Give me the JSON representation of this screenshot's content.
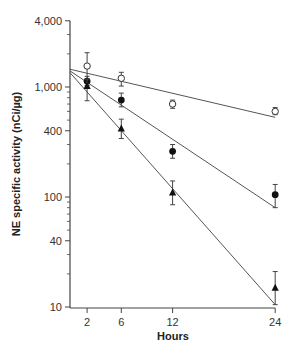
{
  "chart_data": {
    "type": "scatter",
    "title": "",
    "xlabel": "Hours",
    "ylabel": "NE specific activity (nCi/µg)",
    "yscale": "log",
    "xlim": [
      0,
      24
    ],
    "ylim": [
      10,
      4000
    ],
    "x_ticks": [
      2,
      6,
      12,
      24
    ],
    "x_tick_labels": [
      "2",
      "6",
      "12",
      "24"
    ],
    "y_ticks": [
      10,
      40,
      100,
      400,
      1000,
      4000
    ],
    "y_tick_labels": [
      "10",
      "40",
      "100",
      "400",
      "1,000",
      "4,000"
    ],
    "grid": false,
    "legend": null,
    "x": [
      2,
      6,
      12,
      24
    ],
    "series": [
      {
        "name": "open circles",
        "marker": "open-circle",
        "values": [
          1550,
          1200,
          700,
          600
        ],
        "error_low": [
          1150,
          1020,
          640,
          560
        ],
        "error_high": [
          2050,
          1360,
          760,
          650
        ],
        "fit_line": {
          "x": [
            0,
            24
          ],
          "y": [
            1450,
            530
          ]
        }
      },
      {
        "name": "filled circles",
        "marker": "filled-circle",
        "values": [
          1130,
          760,
          260,
          105
        ],
        "error_low": [
          1030,
          660,
          225,
          80
        ],
        "error_high": [
          1250,
          880,
          300,
          130
        ],
        "fit_line": {
          "x": [
            0,
            24
          ],
          "y": [
            1400,
            80
          ]
        }
      },
      {
        "name": "filled triangles",
        "marker": "filled-triangle",
        "values": [
          1020,
          420,
          110,
          15
        ],
        "error_low": [
          750,
          340,
          85,
          10.5
        ],
        "error_high": [
          1180,
          510,
          140,
          21
        ],
        "fit_line": {
          "x": [
            0,
            24
          ],
          "y": [
            1350,
            10.5
          ]
        }
      }
    ]
  },
  "labels": {
    "xlabel": "Hours",
    "ylabel": "NE specific activity (nCi/µg)"
  }
}
